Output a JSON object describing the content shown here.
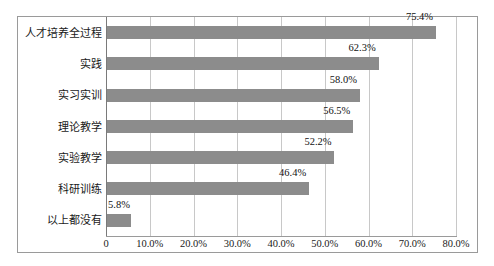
{
  "chart_data": {
    "type": "bar",
    "orientation": "horizontal",
    "title": "",
    "subtitle": "",
    "xlabel": "",
    "ylabel": "",
    "grid": true,
    "legend": false,
    "legend_position": "none",
    "xlim": [
      0,
      0.8
    ],
    "categories": [
      "人才培养全过程",
      "实践",
      "实习实训",
      "理论教学",
      "实验教学",
      "科研训练",
      "以上都没有"
    ],
    "values": [
      0.754,
      0.623,
      0.58,
      0.565,
      0.522,
      0.464,
      0.058
    ],
    "data_labels": [
      "75.4%",
      "62.3%",
      "58.0%",
      "56.5%",
      "52.2%",
      "46.4%",
      "5.8%"
    ],
    "xticks": [
      0,
      0.1,
      0.2,
      0.3,
      0.4,
      0.5,
      0.6,
      0.7,
      0.8
    ],
    "xtick_labels": [
      "0",
      "10.0%",
      "20.0%",
      "30.0%",
      "40.0%",
      "50.0%",
      "60.0%",
      "70.0%",
      "80.0%"
    ],
    "series": [
      {
        "name": "",
        "color": "#8c8c8c",
        "values": [
          0.754,
          0.623,
          0.58,
          0.565,
          0.522,
          0.464,
          0.058
        ]
      }
    ],
    "colors": {
      "bar": "#8c8c8c",
      "gridline": "#c8c8c8",
      "axis": "#7a7a7a",
      "frame": "#9a9a9a",
      "text": "#1a1a1a",
      "background": "#ffffff"
    }
  }
}
